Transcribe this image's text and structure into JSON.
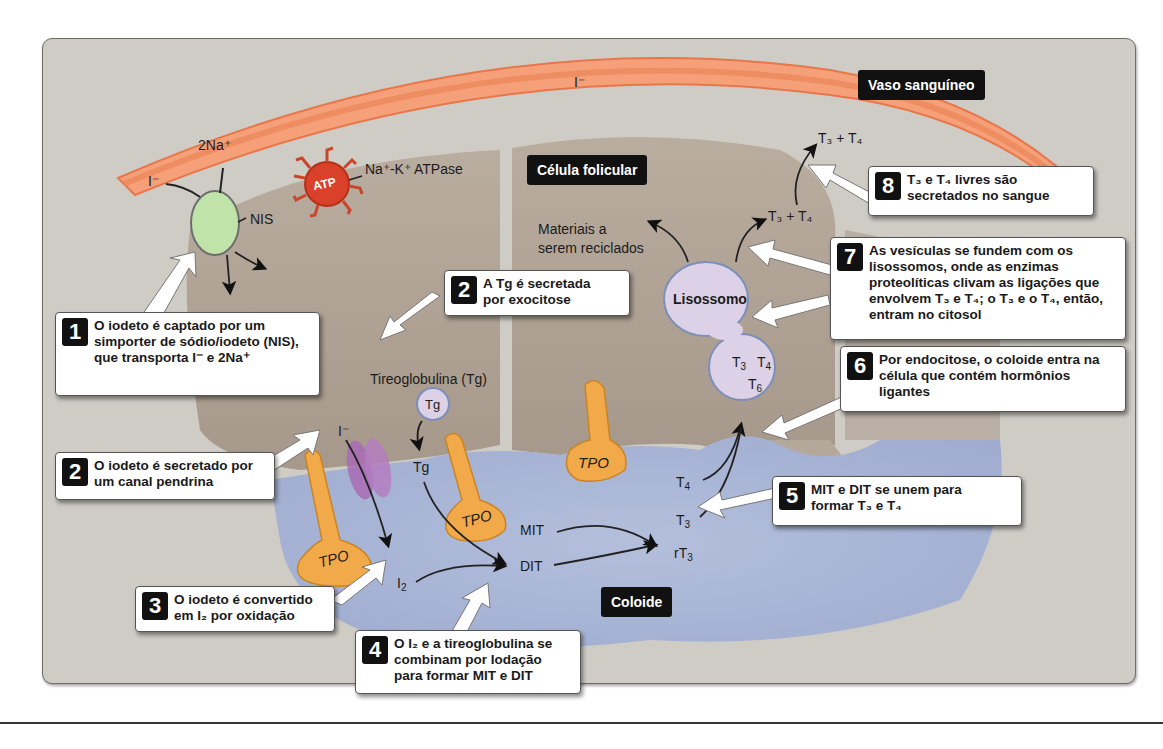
{
  "regions": {
    "blood_vessel": "Vaso sanguíneo",
    "follicular_cell": "Célula folicular",
    "colloid": "Coloide"
  },
  "labels": {
    "iodide_vessel": "I⁻",
    "iodide_nis": "I⁻",
    "sodium": "2Na⁺",
    "nis": "NIS",
    "atpase": "Na⁺-K⁺ ATPase",
    "atp": "ATP",
    "recycled_line1": "Materiais a",
    "recycled_line2": "serem reciclados",
    "thyroglobulin": "Tireoglobulina (Tg)",
    "tg_vesicle": "Tg",
    "tg_colloid": "Tg",
    "iodide_pendrin": "I⁻",
    "i2": "I",
    "i2_sub": "2",
    "mit": "MIT",
    "dit": "DIT",
    "t4": "T",
    "t4_sub": "4",
    "t3": "T",
    "t3_sub": "3",
    "rt3": "rT",
    "rt3_sub": "3",
    "lysosome": "Lisossomo",
    "vesicle_t3": "T",
    "vesicle_t3_sub": "3",
    "vesicle_t4": "T",
    "vesicle_t4_sub": "4",
    "vesicle_t6": "T",
    "vesicle_t6_sub": "6",
    "cytosol_t3t4": "T₃ + T₄",
    "blood_t3t4": "T₃ + T₄",
    "tpo": "TPO"
  },
  "steps": [
    {
      "number": "1",
      "text": "O iodeto é captado por um simporter de sódio/iodeto (NIS), que transporta I⁻ e 2Na⁺"
    },
    {
      "number": "2",
      "text": "O iodeto é secretado por um canal pendrina"
    },
    {
      "number": "2",
      "text": "A Tg é secretada por exocitose"
    },
    {
      "number": "3",
      "text": "O iodeto é convertido em I₂ por oxidação"
    },
    {
      "number": "4",
      "text": "O I₂ e a tireoglobulina se combinam por Iodação para formar MIT e DIT"
    },
    {
      "number": "5",
      "text": "MIT e DIT se unem para formar T₃ e T₄"
    },
    {
      "number": "6",
      "text": "Por endocitose, o coloide entra na célula que contém hormônios ligantes"
    },
    {
      "number": "7",
      "text": "As vesículas se fundem com os lisossomos, onde as enzimas proteolíticas clivam as ligações que envolvem T₃ e T₄; o T₃ e o T₄, então, entram no citosol"
    },
    {
      "number": "8",
      "text": "T₃ e T₄ livres são secretados no sangue"
    }
  ],
  "colors": {
    "panel_bg": "#cfccc6",
    "vessel": "#f08a5a",
    "cell": "#a89a8c",
    "colloid": "#a9b5d6",
    "nis": "#bfe3a8",
    "atpase": "#d9412a",
    "tpo": "#f2a94a",
    "pendrin": "#a86bb4",
    "lysosome": "#dcd1e6"
  }
}
